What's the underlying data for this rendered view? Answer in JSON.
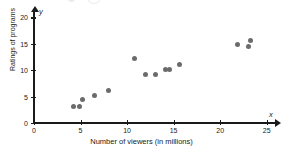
{
  "chart_data": {
    "type": "scatter",
    "title": "",
    "xlabel": "Number of viewers (in millions)",
    "ylabel": "Ratings of programs",
    "x_axis_variable": "x",
    "y_axis_variable": "y",
    "xlim": [
      0,
      26
    ],
    "ylim": [
      0,
      21
    ],
    "xticks": [
      0,
      5,
      10,
      15,
      20,
      25
    ],
    "yticks": [
      0,
      5,
      10,
      15,
      20
    ],
    "grid": false,
    "legend": null,
    "point_color": "#6b6b6b",
    "axis_color": "#1a1a1a",
    "points": [
      {
        "x": 4.2,
        "y": 3.2
      },
      {
        "x": 4.9,
        "y": 3.2
      },
      {
        "x": 5.2,
        "y": 4.4
      },
      {
        "x": 6.5,
        "y": 5.2
      },
      {
        "x": 8.0,
        "y": 6.1
      },
      {
        "x": 10.8,
        "y": 12.2
      },
      {
        "x": 12.0,
        "y": 9.1
      },
      {
        "x": 13.1,
        "y": 9.1
      },
      {
        "x": 14.1,
        "y": 10.2
      },
      {
        "x": 14.6,
        "y": 10.2
      },
      {
        "x": 15.6,
        "y": 11.1
      },
      {
        "x": 21.9,
        "y": 14.8
      },
      {
        "x": 23.0,
        "y": 14.5
      },
      {
        "x": 23.3,
        "y": 15.7
      }
    ]
  }
}
